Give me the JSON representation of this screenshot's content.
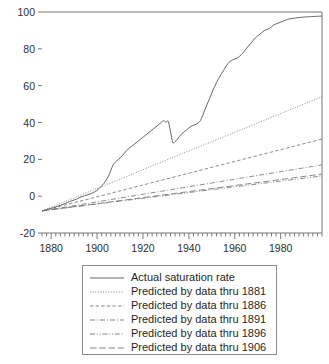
{
  "chart_data": {
    "type": "line",
    "title": "",
    "subtitle": "",
    "xlabel": "",
    "ylabel": "",
    "xlim": [
      1876,
      1998
    ],
    "ylim": [
      -20,
      100
    ],
    "grid": false,
    "legend_position": "below-plot",
    "y_ticks": [
      -20,
      0,
      20,
      40,
      60,
      80,
      100
    ],
    "y_tick_labels": [
      "-20",
      "0",
      "20",
      "40",
      "60",
      "80",
      "100"
    ],
    "x_ticks": [
      1880,
      1900,
      1920,
      1940,
      1960,
      1980
    ],
    "x_tick_labels": [
      "1880",
      "1900",
      "1920",
      "1940",
      "1960",
      "1980"
    ],
    "x_minor_tick_interval": 2,
    "series": [
      {
        "name": "Actual saturation rate",
        "style": "solid",
        "color": "#555555",
        "x": [
          1876,
          1880,
          1884,
          1888,
          1891,
          1893,
          1895,
          1897,
          1899,
          1901,
          1903,
          1905,
          1907,
          1909,
          1911,
          1913,
          1915,
          1917,
          1919,
          1921,
          1923,
          1925,
          1927,
          1929,
          1930,
          1931,
          1932,
          1933,
          1934,
          1935,
          1937,
          1939,
          1941,
          1943,
          1945,
          1947,
          1949,
          1951,
          1953,
          1955,
          1957,
          1959,
          1961,
          1963,
          1965,
          1967,
          1969,
          1971,
          1973,
          1975,
          1977,
          1979,
          1981,
          1983,
          1985,
          1988,
          1992,
          1998
        ],
        "y": [
          -8.0,
          -6.6,
          -5.0,
          -3.0,
          -1.6,
          -0.4,
          0.4,
          1.2,
          2.4,
          4.2,
          7.0,
          11.0,
          17.0,
          19.6,
          22.0,
          25.0,
          27.0,
          29.0,
          31.0,
          33.0,
          35.0,
          37.0,
          39.0,
          41.0,
          40.0,
          40.6,
          35.0,
          29.2,
          29.6,
          31.0,
          34.0,
          36.0,
          38.0,
          39.0,
          41.0,
          47.0,
          53.0,
          59.0,
          64.0,
          68.0,
          72.0,
          74.0,
          75.0,
          77.0,
          80.0,
          83.0,
          86.0,
          88.0,
          90.0,
          91.0,
          93.0,
          94.0,
          95.0,
          96.0,
          96.5,
          97.0,
          97.4,
          97.8
        ]
      },
      {
        "name": "Predicted by data thru 1881",
        "style": "dotted",
        "color": "#6e6e6e",
        "x": [
          1876,
          1998
        ],
        "y": [
          -8.0,
          54.0
        ]
      },
      {
        "name": "Predicted by data thru 1886",
        "style": "dashed",
        "color": "#6e6e6e",
        "x": [
          1876,
          1998
        ],
        "y": [
          -8.0,
          31.0
        ]
      },
      {
        "name": "Predicted by data thru 1891",
        "style": "dash-dot",
        "color": "#6e6e6e",
        "x": [
          1876,
          1998
        ],
        "y": [
          -8.0,
          17.0
        ]
      },
      {
        "name": "Predicted by data thru 1896",
        "style": "dash-dot-dot",
        "color": "#6e6e6e",
        "x": [
          1876,
          1998
        ],
        "y": [
          -8.0,
          11.0
        ]
      },
      {
        "name": "Predicted by data thru 1906",
        "style": "long-dash",
        "color": "#6e6e6e",
        "x": [
          1876,
          1998
        ],
        "y": [
          -8.0,
          12.0
        ]
      }
    ]
  },
  "legend": {
    "entries": [
      {
        "label": "Actual saturation rate"
      },
      {
        "label": "Predicted by data thru 1881"
      },
      {
        "label": "Predicted by data thru 1886"
      },
      {
        "label": "Predicted by data thru 1891"
      },
      {
        "label": "Predicted by data thru 1896"
      },
      {
        "label": "Predicted by data thru 1906"
      }
    ]
  },
  "colors": {
    "axis": "#777777",
    "line": "#666666",
    "text": "#222222",
    "legend_border": "#8d8d8d",
    "background": "#ffffff"
  }
}
